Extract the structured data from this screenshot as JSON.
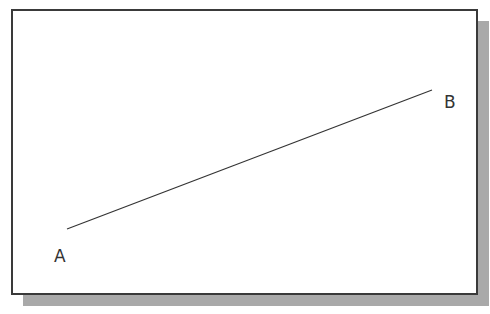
{
  "diagram": {
    "points": [
      {
        "label": "A",
        "x": 67,
        "y": 229
      },
      {
        "label": "B",
        "x": 432,
        "y": 90
      }
    ],
    "line": {
      "from": "A",
      "to": "B",
      "color": "#333333"
    },
    "labels": {
      "a": "A",
      "b": "B"
    },
    "colors": {
      "frame_border": "#3a3a3a",
      "shadow": "#a9a9a9",
      "background": "#ffffff"
    }
  }
}
